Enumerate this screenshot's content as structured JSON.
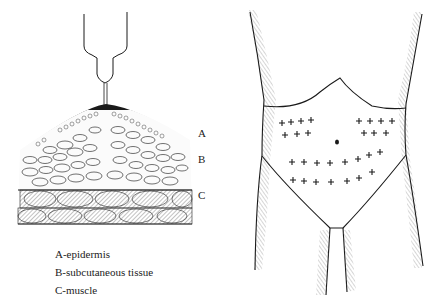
{
  "left_figure": {
    "title": "Subcutaneous injection cross-section",
    "layer_labels": [
      {
        "letter": "A",
        "x": 198,
        "y": 134
      },
      {
        "letter": "B",
        "x": 198,
        "y": 160
      },
      {
        "letter": "C",
        "x": 198,
        "y": 196
      }
    ],
    "legend": [
      {
        "key": "A",
        "text": "A-epidermis"
      },
      {
        "key": "B",
        "text": "B-subcutaneous tissue"
      },
      {
        "key": "C",
        "text": "C-muscle"
      }
    ]
  },
  "right_figure": {
    "title": "Abdomen injection sites",
    "umbilicus": {
      "x": 337,
      "y": 142
    },
    "injection_marks": {
      "symbol": "+",
      "upper_left": [
        [
          282,
          123
        ],
        [
          291,
          122
        ],
        [
          301,
          121
        ],
        [
          311,
          120
        ],
        [
          285,
          135
        ],
        [
          297,
          134
        ],
        [
          308,
          133
        ]
      ],
      "upper_right": [
        [
          359,
          121
        ],
        [
          370,
          121
        ],
        [
          381,
          121
        ],
        [
          392,
          121
        ],
        [
          364,
          133
        ],
        [
          374,
          133
        ],
        [
          386,
          133
        ]
      ],
      "lower_row_1": [
        [
          292,
          162
        ],
        [
          304,
          162
        ],
        [
          317,
          163
        ],
        [
          330,
          163
        ],
        [
          345,
          162
        ],
        [
          358,
          159
        ],
        [
          369,
          155
        ],
        [
          380,
          152
        ]
      ],
      "lower_row_2": [
        [
          293,
          180
        ],
        [
          304,
          181
        ],
        [
          316,
          182
        ],
        [
          331,
          182
        ],
        [
          347,
          181
        ],
        [
          359,
          178
        ],
        [
          372,
          172
        ]
      ]
    }
  },
  "colors": {
    "ink": "#1a1a1a",
    "hatch": "#555555",
    "background": "#ffffff"
  }
}
